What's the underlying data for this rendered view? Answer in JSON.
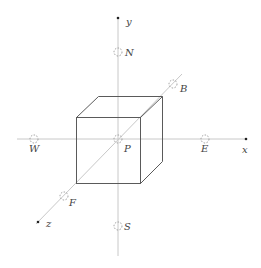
{
  "diagram": {
    "type": "3d-coordinate-axes-with-cube",
    "axes": [
      {
        "id": "x",
        "label": "x"
      },
      {
        "id": "y",
        "label": "y"
      },
      {
        "id": "z",
        "label": "z"
      }
    ],
    "origin": {
      "id": "P",
      "label": "P"
    },
    "points": [
      {
        "id": "N",
        "label": "N",
        "axis": "y",
        "direction": "positive"
      },
      {
        "id": "S",
        "label": "S",
        "axis": "y",
        "direction": "negative"
      },
      {
        "id": "E",
        "label": "E",
        "axis": "x",
        "direction": "positive"
      },
      {
        "id": "W",
        "label": "W",
        "axis": "x",
        "direction": "negative"
      },
      {
        "id": "B",
        "label": "B",
        "axis": "z",
        "direction": "negative"
      },
      {
        "id": "F",
        "label": "F",
        "axis": "z",
        "direction": "positive"
      }
    ],
    "colors": {
      "axis": "#c8c8c8",
      "cube": "#5a5a5a",
      "marker": "#9a9a9a",
      "label": "#444444"
    }
  }
}
